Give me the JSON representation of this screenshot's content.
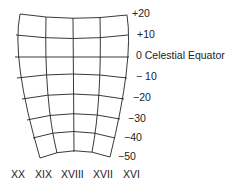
{
  "diagram": {
    "type": "celestial-coordinate-grid",
    "declination_labels": [
      {
        "text": "+20",
        "x": 132,
        "y": 9
      },
      {
        "text": "+10",
        "x": 137,
        "y": 29
      },
      {
        "text": "0 Celestial Equator",
        "x": 136,
        "y": 50
      },
      {
        "text": "− 10",
        "x": 134,
        "y": 71
      },
      {
        "text": "−20",
        "x": 133,
        "y": 92
      },
      {
        "text": "−30",
        "x": 128,
        "y": 113
      },
      {
        "text": "−40",
        "x": 124,
        "y": 133
      },
      {
        "text": "−50",
        "x": 118,
        "y": 151
      }
    ],
    "right_ascension_labels": [
      {
        "text": "XX",
        "x": 11
      },
      {
        "text": "XIX",
        "x": 35
      },
      {
        "text": "XVIII",
        "x": 61
      },
      {
        "text": "XVII",
        "x": 93
      },
      {
        "text": "XVI",
        "x": 123
      }
    ],
    "line_color": "#222222"
  }
}
